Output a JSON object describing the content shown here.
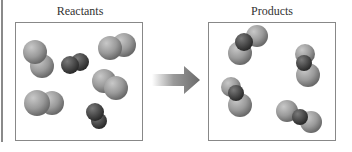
{
  "diagram": {
    "left_panel": {
      "title": "Reactants"
    },
    "right_panel": {
      "title": "Products"
    },
    "arrow": {
      "direction": "right",
      "color": "#6e6e6e"
    },
    "colors": {
      "light_atom": "#9a9a9a",
      "dark_atom": "#4a4a4a"
    }
  }
}
